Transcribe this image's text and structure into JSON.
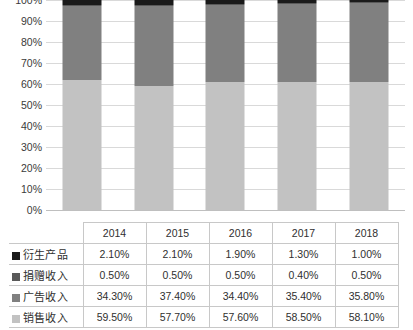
{
  "chart_data": {
    "type": "bar",
    "subtype": "stacked-100-percent-column",
    "title": "",
    "xlabel": "",
    "ylabel": "",
    "categories": [
      "2014",
      "2015",
      "2016",
      "2017",
      "2018"
    ],
    "ylim": [
      0,
      100
    ],
    "y_tick_labels": [
      "100%",
      "90%",
      "80%",
      "70%",
      "60%",
      "50%",
      "40%",
      "30%",
      "20%",
      "10%",
      "0%"
    ],
    "y_ticks": [
      100,
      90,
      80,
      70,
      60,
      50,
      40,
      30,
      20,
      10,
      0
    ],
    "grid": true,
    "legend_position": "table-left",
    "stack_order_bottom_to_top": [
      "销售收入",
      "广告收入",
      "捐赠收入",
      "衍生产品"
    ],
    "series": [
      {
        "name": "衍生产品",
        "color": "#1a1a1a",
        "values": [
          2.1,
          2.1,
          1.9,
          1.3,
          1.0
        ],
        "labels": [
          "2.10%",
          "2.10%",
          "1.90%",
          "1.30%",
          "1.00%"
        ]
      },
      {
        "name": "捐赠收入",
        "color": "#595959",
        "values": [
          0.5,
          0.5,
          0.5,
          0.4,
          0.5
        ],
        "labels": [
          "0.50%",
          "0.50%",
          "0.50%",
          "0.40%",
          "0.50%"
        ]
      },
      {
        "name": "广告收入",
        "color": "#808080",
        "values": [
          34.3,
          37.4,
          34.4,
          35.4,
          35.8
        ],
        "labels": [
          "34.30%",
          "37.40%",
          "34.40%",
          "35.40%",
          "35.80%"
        ]
      },
      {
        "name": "销售收入",
        "color": "#c2c2c2",
        "values": [
          59.5,
          57.7,
          57.6,
          58.5,
          58.1
        ],
        "labels": [
          "59.50%",
          "57.70%",
          "57.60%",
          "58.50%",
          "58.10%"
        ]
      }
    ]
  },
  "table": {
    "header": {
      "corner_label": "",
      "years": [
        "2014",
        "2015",
        "2016",
        "2017",
        "2018"
      ]
    },
    "rows": [
      {
        "label": "衍生产品",
        "swatch_color": "#1a1a1a",
        "cells": [
          "2.10%",
          "2.10%",
          "1.90%",
          "1.30%",
          "1.00%"
        ]
      },
      {
        "label": "捐赠收入",
        "swatch_color": "#595959",
        "cells": [
          "0.50%",
          "0.50%",
          "0.50%",
          "0.40%",
          "0.50%"
        ]
      },
      {
        "label": "广告收入",
        "swatch_color": "#808080",
        "cells": [
          "34.30%",
          "37.40%",
          "34.40%",
          "35.40%",
          "35.80%"
        ]
      },
      {
        "label": "销售收入",
        "swatch_color": "#c2c2c2",
        "cells": [
          "59.50%",
          "57.70%",
          "57.60%",
          "58.50%",
          "58.10%"
        ]
      }
    ]
  },
  "colors": {
    "gridline": "#d9d9d9",
    "baseline": "#bfbfbf",
    "table_border": "#c8c8c8",
    "background": "#ffffff"
  }
}
